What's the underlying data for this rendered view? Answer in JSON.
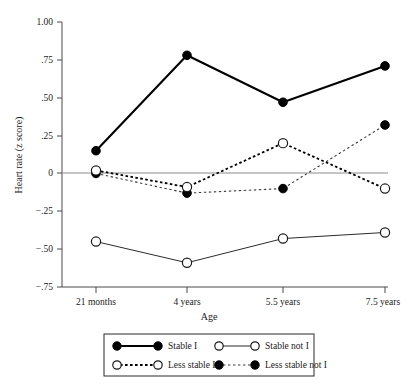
{
  "figure": {
    "background_color": "#ffffff"
  },
  "chart_data": {
    "type": "line",
    "title": "",
    "xlabel": "Age",
    "ylabel": "Heart rate (z score)",
    "categories": [
      "21 months",
      "4 years",
      "5.5 years",
      "7.5 years"
    ],
    "ylim": [
      -0.75,
      1.0
    ],
    "ytick_values": [
      1.0,
      0.75,
      0.5,
      0.25,
      0,
      -0.25,
      -0.5,
      -0.75
    ],
    "ytick_labels": [
      "1.00",
      ".75",
      ".50",
      ".25",
      "0",
      "−.25",
      "−.50",
      "−.75"
    ],
    "grid": false,
    "zero_reference_line": true,
    "legend_position": "bottom",
    "series": [
      {
        "name": "Stable I",
        "values": [
          0.15,
          0.78,
          0.47,
          0.71
        ],
        "marker": "filled-circle",
        "line_style": "solid",
        "line_weight": "thick",
        "color": "#000000"
      },
      {
        "name": "Stable not I",
        "values": [
          -0.45,
          -0.59,
          -0.43,
          -0.39
        ],
        "marker": "open-circle",
        "line_style": "solid",
        "line_weight": "thin",
        "color": "#2b2b2b"
      },
      {
        "name": "Less stable I",
        "values": [
          0.02,
          -0.09,
          0.2,
          -0.1
        ],
        "marker": "open-circle",
        "line_style": "dotted",
        "line_weight": "thick",
        "color": "#000000"
      },
      {
        "name": "Less stable not I",
        "values": [
          0.0,
          -0.13,
          -0.1,
          0.32
        ],
        "marker": "filled-circle",
        "line_style": "dotted",
        "line_weight": "thin",
        "color": "#3a3a3a"
      }
    ]
  },
  "legend": {
    "entries": [
      {
        "label": "Stable I",
        "marker": "filled-circle",
        "line_style": "solid"
      },
      {
        "label": "Stable not I",
        "marker": "open-circle",
        "line_style": "solid"
      },
      {
        "label": "Less stable I",
        "marker": "open-circle",
        "line_style": "dotted"
      },
      {
        "label": "Less stable not I",
        "marker": "filled-circle",
        "line_style": "dotted"
      }
    ]
  }
}
